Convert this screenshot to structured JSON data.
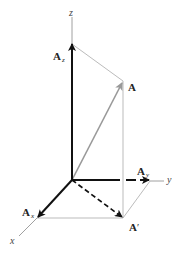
{
  "diagram": {
    "axes": {
      "x": {
        "label": "x"
      },
      "y": {
        "label": "y"
      },
      "z": {
        "label": "z"
      }
    },
    "vectors": {
      "A": {
        "label": "A"
      },
      "Ax": {
        "label": "A",
        "subscript": "x"
      },
      "Ay": {
        "label": "A",
        "subscript": "y"
      },
      "Az": {
        "label": "A",
        "subscript": "z"
      },
      "A_prime": {
        "label": "A",
        "prime": "′"
      }
    },
    "colors": {
      "axis": "#888888",
      "component": "#111111",
      "vector_A": "#999999",
      "construction": "#aaaaaa"
    }
  }
}
